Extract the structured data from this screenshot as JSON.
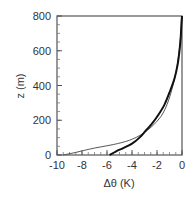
{
  "chart_data": {
    "type": "line",
    "title": "",
    "xlabel": "Δθ (K)",
    "ylabel": "z (m)",
    "xlim": [
      -10,
      0
    ],
    "ylim": [
      0,
      800
    ],
    "xticks": [
      -10,
      -8,
      -6,
      -4,
      -2,
      0
    ],
    "yticks": [
      0,
      200,
      400,
      600,
      800
    ],
    "grid": false,
    "legend": null,
    "series": [
      {
        "name": "thin",
        "style": "thin",
        "x": [
          -9.5,
          -8.5,
          -7.0,
          -5.5,
          -4.2,
          -3.2,
          -2.4,
          -1.7,
          -1.2,
          -0.8,
          -0.5,
          -0.3,
          -0.15,
          -0.05,
          0.0
        ],
        "y": [
          0,
          15,
          40,
          60,
          85,
          120,
          165,
          220,
          290,
          380,
          470,
          560,
          650,
          730,
          800
        ]
      },
      {
        "name": "thick",
        "style": "thick",
        "x": [
          -5.8,
          -5.3,
          -4.7,
          -4.0,
          -3.4,
          -2.9,
          -2.4,
          -1.9,
          -1.4,
          -1.0,
          -0.6,
          -0.35,
          -0.2,
          -0.1,
          -0.05,
          0.0
        ],
        "y": [
          0,
          20,
          40,
          65,
          100,
          140,
          180,
          230,
          290,
          360,
          440,
          520,
          600,
          680,
          750,
          800
        ]
      }
    ]
  },
  "axes": {
    "xlabel": "Δθ (K)",
    "ylabel": "z (m)",
    "xtick_labels": [
      "-10",
      "-8",
      "-6",
      "-4",
      "-2",
      "0"
    ],
    "ytick_labels": [
      "0",
      "200",
      "400",
      "600",
      "800"
    ]
  }
}
